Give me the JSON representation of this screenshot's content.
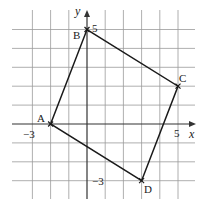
{
  "diagram": {
    "type": "coordinate-grid",
    "colors": {
      "grid": "#9a9a9a",
      "axis": "#333333",
      "shape": "#1a1a1a",
      "text": "#1a1a1a",
      "background": "#ffffff"
    },
    "grid": {
      "x_min": -4,
      "x_max": 5,
      "y_min": -4,
      "y_max": 5,
      "step": 1
    },
    "axes": {
      "x_label": "x",
      "y_label": "y"
    },
    "tick_labels": [
      {
        "id": "x-neg3",
        "axis": "x",
        "value": -3,
        "text": "−3"
      },
      {
        "id": "x-5",
        "axis": "x",
        "value": 5,
        "text": "5"
      },
      {
        "id": "y-5",
        "axis": "y",
        "value": 5,
        "text": "5"
      },
      {
        "id": "y-neg3",
        "axis": "y",
        "value": -3,
        "text": "−3"
      }
    ],
    "points": [
      {
        "label": "A",
        "x": -2,
        "y": 0
      },
      {
        "label": "B",
        "x": 0,
        "y": 5
      },
      {
        "label": "C",
        "x": 5,
        "y": 2
      },
      {
        "label": "D",
        "x": 3,
        "y": -3
      }
    ],
    "shape": {
      "name": "square",
      "vertices": [
        "A",
        "B",
        "C",
        "D"
      ]
    }
  }
}
